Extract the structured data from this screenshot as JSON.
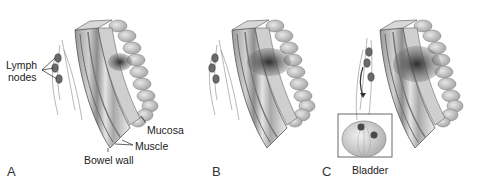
{
  "figure": {
    "panels": [
      {
        "letter": "A",
        "has_tumor_depth": "mucosa",
        "labels": {
          "lymph": "Lymph",
          "nodes": "nodes",
          "mucosa": "Mucosa",
          "muscle": "Muscle",
          "bowel_wall": "Bowel wall"
        }
      },
      {
        "letter": "B",
        "has_tumor_depth": "muscle"
      },
      {
        "letter": "C",
        "has_tumor_depth": "full-thickness",
        "labels": {
          "bladder": "Bladder"
        }
      }
    ],
    "colors": {
      "line": "#444444",
      "wall_dark": "#8a8a8a",
      "wall_mid": "#bdbdbd",
      "wall_light": "#e6e6e6",
      "villi": "#b4b4b4",
      "tumor": "#3a3a3a",
      "node": "#6a6a6a"
    }
  }
}
